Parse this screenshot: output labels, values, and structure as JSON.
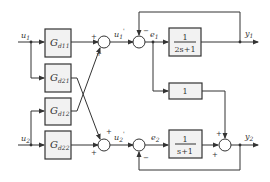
{
  "diagram": {
    "type": "control block diagram",
    "inputs": [
      {
        "name": "u",
        "sub": "1"
      },
      {
        "name": "u",
        "sub": "2"
      }
    ],
    "decoupler_blocks": [
      {
        "name": "G",
        "sub": "d11"
      },
      {
        "name": "G",
        "sub": "d21"
      },
      {
        "name": "G",
        "sub": "d12"
      },
      {
        "name": "G",
        "sub": "d22"
      }
    ],
    "intermediate_signals": [
      {
        "name": "u",
        "sub": "1",
        "sup": "'"
      },
      {
        "name": "u",
        "sub": "2",
        "sup": "'"
      }
    ],
    "errors": [
      {
        "name": "e",
        "sub": "1"
      },
      {
        "name": "e",
        "sub": "2"
      }
    ],
    "plant_blocks": {
      "g11": {
        "num": "1",
        "den": "2s+1"
      },
      "g21": {
        "label": "1"
      },
      "g22": {
        "num": "1",
        "den": "s+1"
      }
    },
    "outputs": [
      {
        "name": "y",
        "sub": "1"
      },
      {
        "name": "y",
        "sub": "2"
      }
    ],
    "signs": {
      "plus": "+",
      "minus": "−"
    }
  }
}
